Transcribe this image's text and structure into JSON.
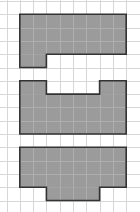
{
  "diagram": {
    "type": "grid-polyomino-figures",
    "grid": {
      "cell_size_px": 13.3,
      "origin_x": 6.5,
      "origin_y": 1,
      "columns": 10,
      "rows": 16,
      "line_color": "#d6d6d6",
      "background": "#ffffff"
    },
    "style": {
      "fill_color": "#9b9b9b",
      "outline_color": "#333333",
      "inner_grid_color": "#b3b3b3"
    },
    "shapes": [
      {
        "id": "shape-1",
        "description": "8x3 rectangle with 2-cell tab below bottom-left",
        "cells": [
          {
            "rows": [
              1,
              3
            ],
            "cols": [
              1,
              8
            ]
          },
          {
            "rows": [
              4,
              4
            ],
            "cols": [
              1,
              2
            ]
          }
        ],
        "outline": [
          [
            1,
            1
          ],
          [
            9,
            1
          ],
          [
            9,
            4
          ],
          [
            3,
            4
          ],
          [
            3,
            5
          ],
          [
            1,
            5
          ]
        ]
      },
      {
        "id": "shape-2",
        "description": "8x3 rectangle with 2-cell tabs on top-left and top-right",
        "cells": [
          {
            "rows": [
              6,
              6
            ],
            "cols": [
              1,
              2
            ]
          },
          {
            "rows": [
              6,
              6
            ],
            "cols": [
              7,
              8
            ]
          },
          {
            "rows": [
              7,
              9
            ],
            "cols": [
              1,
              8
            ]
          }
        ],
        "outline": [
          [
            1,
            6
          ],
          [
            3,
            6
          ],
          [
            3,
            7
          ],
          [
            7,
            7
          ],
          [
            7,
            6
          ],
          [
            9,
            6
          ],
          [
            9,
            10
          ],
          [
            1,
            10
          ]
        ]
      },
      {
        "id": "shape-3",
        "description": "8x3 rectangle with 4-cell tab centered below",
        "cells": [
          {
            "rows": [
              11,
              13
            ],
            "cols": [
              1,
              8
            ]
          },
          {
            "rows": [
              14,
              14
            ],
            "cols": [
              3,
              6
            ]
          }
        ],
        "outline": [
          [
            1,
            11
          ],
          [
            9,
            11
          ],
          [
            9,
            14
          ],
          [
            7,
            14
          ],
          [
            7,
            15
          ],
          [
            3,
            15
          ],
          [
            3,
            14
          ],
          [
            1,
            14
          ]
        ]
      }
    ]
  }
}
